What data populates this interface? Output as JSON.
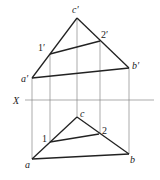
{
  "diagram": {
    "axis_label": "X",
    "upper_view": {
      "c_prime": "c′",
      "one_prime": "1′",
      "two_prime": "2′",
      "a_prime": "a′",
      "b_prime": "b′"
    },
    "lower_view": {
      "c": "c",
      "one": "1",
      "two": "2",
      "a": "a",
      "b": "b"
    },
    "points": {
      "a_prime": [
        32,
        78
      ],
      "b_prime": [
        129,
        68
      ],
      "c_prime": [
        77,
        18
      ],
      "one_prime": [
        50,
        54
      ],
      "two_prime": [
        100,
        41
      ],
      "a": [
        32,
        159
      ],
      "b": [
        129,
        154
      ],
      "c": [
        77,
        117
      ],
      "one": [
        50,
        142
      ],
      "two": [
        99,
        134
      ]
    },
    "x_axis_y": 100,
    "colors": {
      "thick_line": "#222222",
      "thin_line": "#888888"
    }
  }
}
